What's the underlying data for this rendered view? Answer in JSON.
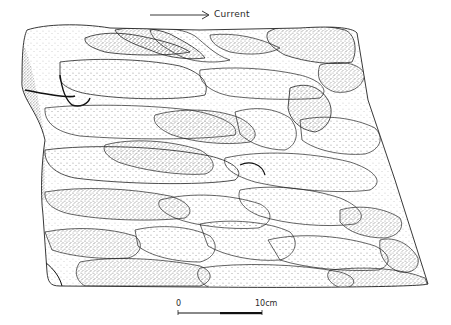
{
  "figure": {
    "type": "stippled geological illustration",
    "ink_color": "#1a1a1a",
    "background_color": "#ffffff"
  },
  "current_indicator": {
    "label": "Current",
    "direction": "right",
    "icon": "arrow-right-icon"
  },
  "scale_bar": {
    "start_label": "0",
    "end_label": "10cm",
    "segments": 2
  }
}
